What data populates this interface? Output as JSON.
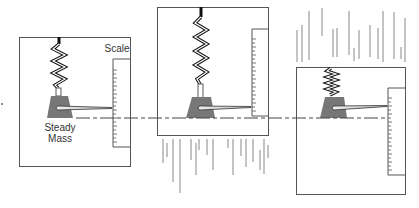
{
  "diagram": {
    "labels": {
      "scale": "Scale",
      "mass_line1": "Steady",
      "mass_line2": "Mass"
    },
    "colors": {
      "frame": "#555555",
      "mass": "#777777",
      "pointer_fill": "#d9d9d9",
      "spring_dark": "#111111",
      "motion_lines": "#888888"
    },
    "panels": [
      {
        "id": "panel-1",
        "motion": "none"
      },
      {
        "id": "panel-2",
        "motion": "upward",
        "motion_lines_position": "below"
      },
      {
        "id": "panel-3",
        "motion": "downward",
        "motion_lines_position": "above"
      }
    ]
  }
}
